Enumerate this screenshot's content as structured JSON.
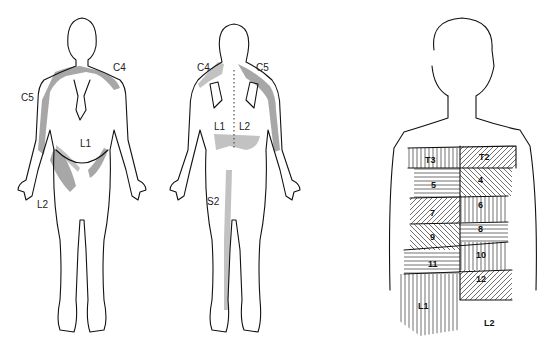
{
  "figure": {
    "panels": [
      {
        "id": "front-view",
        "labels": [
          {
            "text": "C4",
            "x": 113,
            "y": 71
          },
          {
            "text": "C5",
            "x": 21,
            "y": 101
          },
          {
            "text": "L1",
            "x": 80,
            "y": 147
          },
          {
            "text": "L2",
            "x": 37,
            "y": 208
          }
        ]
      },
      {
        "id": "back-view",
        "labels": [
          {
            "text": "C4",
            "x": 197,
            "y": 71
          },
          {
            "text": "C5",
            "x": 256,
            "y": 71
          },
          {
            "text": "L1",
            "x": 214,
            "y": 130
          },
          {
            "text": "L2",
            "x": 239,
            "y": 130
          },
          {
            "text": "S2",
            "x": 207,
            "y": 205
          }
        ]
      },
      {
        "id": "torso-segments",
        "labels": [
          {
            "text": "T3",
            "x": 425,
            "y": 163
          },
          {
            "text": "T2",
            "x": 479,
            "y": 160
          },
          {
            "text": "5",
            "x": 431,
            "y": 188
          },
          {
            "text": "4",
            "x": 478,
            "y": 183
          },
          {
            "text": "6",
            "x": 478,
            "y": 208
          },
          {
            "text": "7",
            "x": 430,
            "y": 216
          },
          {
            "text": "8",
            "x": 478,
            "y": 232
          },
          {
            "text": "9",
            "x": 430,
            "y": 240
          },
          {
            "text": "10",
            "x": 476,
            "y": 258
          },
          {
            "text": "11",
            "x": 428,
            "y": 267
          },
          {
            "text": "12",
            "x": 476,
            "y": 282
          },
          {
            "text": "L1",
            "x": 418,
            "y": 309
          },
          {
            "text": "L2",
            "x": 484,
            "y": 326
          }
        ]
      }
    ]
  }
}
